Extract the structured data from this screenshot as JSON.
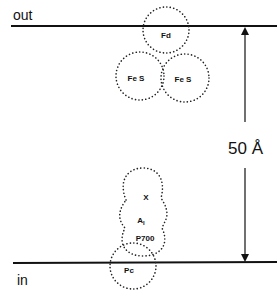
{
  "labels": {
    "out": "out",
    "in": "in",
    "distance": "50 Å"
  },
  "components": [
    {
      "id": "Fd",
      "label": "Fd"
    },
    {
      "id": "FeS-left",
      "label": "Fe S"
    },
    {
      "id": "FeS-right",
      "label": "Fe S"
    },
    {
      "id": "X",
      "label": "X"
    },
    {
      "id": "A1",
      "label": "A",
      "subscript": "I"
    },
    {
      "id": "P700",
      "label": "P700"
    },
    {
      "id": "Pc",
      "label": "Pc"
    }
  ],
  "colors": {
    "ink": "#111111",
    "background": "#ffffff"
  }
}
